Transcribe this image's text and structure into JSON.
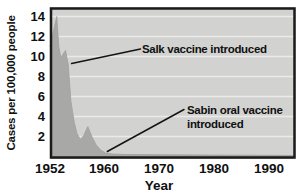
{
  "figure": {
    "x_axis_title": "Year",
    "y_axis_title": "Cases per 100,000 people"
  },
  "annotations": {
    "salk": {
      "label": "Salk vaccine introduced",
      "target_year": 1955.2,
      "target_value": 9.3
    },
    "sabin": {
      "label": "Sabin oral vaccine introduced",
      "line1": "Sabin oral vaccine",
      "line2": "introduced",
      "target_year": 1960.6,
      "target_value": 0.5
    }
  },
  "chart_data": {
    "type": "area",
    "title": "",
    "xlabel": "Year",
    "ylabel": "Cases per 100,000 people",
    "x_ticks": [
      1952,
      1960,
      1970,
      1980,
      1990
    ],
    "y_ticks": [
      2,
      4,
      6,
      8,
      10,
      12,
      14
    ],
    "xlim": [
      1952,
      1994.4
    ],
    "ylim": [
      0,
      14.8
    ],
    "grid": "horizontal-white-lines",
    "legend": "none",
    "series": [
      {
        "name": "Polio cases per 100,000 people (U.S.)",
        "points": [
          [
            1952.0,
            11.0
          ],
          [
            1952.4,
            12.2
          ],
          [
            1953.0,
            14.0
          ],
          [
            1953.3,
            11.0
          ],
          [
            1953.6,
            9.9
          ],
          [
            1954.3,
            10.6
          ],
          [
            1954.7,
            9.2
          ],
          [
            1955.1,
            5.5
          ],
          [
            1955.6,
            3.4
          ],
          [
            1956.0,
            2.3
          ],
          [
            1956.5,
            1.7
          ],
          [
            1957.0,
            2.1
          ],
          [
            1957.6,
            3.0
          ],
          [
            1958.2,
            2.0
          ],
          [
            1958.8,
            1.2
          ],
          [
            1959.5,
            0.65
          ],
          [
            1960.3,
            0.35
          ],
          [
            1961.5,
            0.25
          ],
          [
            1964.0,
            0.2
          ],
          [
            1970.0,
            0.18
          ],
          [
            1980.0,
            0.14
          ],
          [
            1990.0,
            0.12
          ],
          [
            1994.4,
            0.1
          ]
        ]
      }
    ],
    "colors": {
      "plot_background": "#d2d3d1",
      "gridline": "#eceae9",
      "area_fill": "#a8a9a7",
      "area_edge": "#9fa09e",
      "frame": "#1b1b1b",
      "leader_line": "#141414",
      "text": "#101010"
    }
  }
}
